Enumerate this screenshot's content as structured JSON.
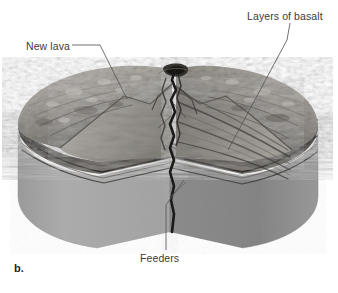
{
  "figure": {
    "letter": "b.",
    "type": "geologic block diagram",
    "background_color": "#ffffff"
  },
  "annotations": [
    {
      "id": "new-lava",
      "label": "New lava",
      "leader": "horizontal-then-diagonal",
      "target_description": "fresh lava flow on upper-left flank"
    },
    {
      "id": "layers-of-basalt",
      "label": "Layers of basalt",
      "leader": "diagonal",
      "target_description": "stacked basalt strata exposed in right cut face"
    },
    {
      "id": "feeders",
      "label": "Feeders",
      "leader": "vertical-then-diagonal",
      "target_description": "vertical feeder dikes beneath the summit vent"
    }
  ],
  "colors": {
    "base_rock_front_left": "#a9a9a9",
    "base_rock_front_right": "#8f8f8f",
    "base_rock_left_edge": "#9d9d9d",
    "flank_light": "#b4b0aa",
    "flank_mid": "#8d8a85",
    "flank_dark": "#5d5a56",
    "basalt_band_dark": "#3a3734",
    "basalt_band_mid": "#615d58",
    "dike_dark": "#1f1d1b",
    "summit_crater": "#2b2926",
    "leader_line": "#555555",
    "label_text": "#3b3b3b",
    "figure_letter": "#1c1c1c"
  }
}
